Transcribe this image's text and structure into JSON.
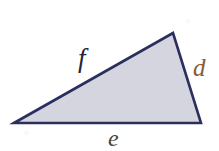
{
  "figure": {
    "kind": "geometry-diagram",
    "background_color": "#ffffff",
    "width": 219,
    "height": 151
  },
  "triangle": {
    "name": "triangle-shape",
    "fill_color": "#d5d5e0",
    "stroke_color": "#2b2f5e",
    "stroke_width": 2.6,
    "vertices": [
      {
        "name": "left-vertex",
        "x": 14,
        "y": 123
      },
      {
        "name": "apex-vertex",
        "x": 173,
        "y": 33
      },
      {
        "name": "right-vertex",
        "x": 201,
        "y": 123
      }
    ]
  },
  "labels": {
    "side_f": {
      "text": "f",
      "color": "#23243c",
      "side": "upper-left-side",
      "from_vertex": "left-vertex",
      "to_vertex": "apex-vertex"
    },
    "side_d": {
      "text": "d",
      "color": "#8a5a33",
      "side": "right-side",
      "from_vertex": "apex-vertex",
      "to_vertex": "right-vertex"
    },
    "side_e": {
      "text": "e",
      "color": "#42473a",
      "side": "bottom-side",
      "from_vertex": "left-vertex",
      "to_vertex": "right-vertex"
    }
  }
}
